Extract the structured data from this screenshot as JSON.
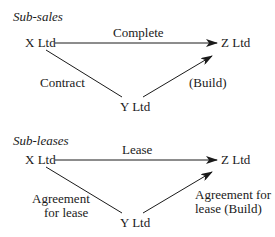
{
  "diagrams": [
    {
      "title": "Sub-sales",
      "nodes": {
        "x": "X Ltd",
        "y": "Y Ltd",
        "z": "Z Ltd"
      },
      "edges": {
        "x_to_z": "Complete",
        "x_to_y": "Contract",
        "y_to_z": "(Build)"
      }
    },
    {
      "title": "Sub-leases",
      "nodes": {
        "x": "X Ltd",
        "y": "Y Ltd",
        "z": "Z Ltd"
      },
      "edges": {
        "x_to_z": "Lease",
        "x_to_y_line1": "Agreement",
        "x_to_y_line2": "for lease",
        "y_to_z_line1": "Agreement for",
        "y_to_z_line2": "lease (Build)"
      }
    }
  ]
}
